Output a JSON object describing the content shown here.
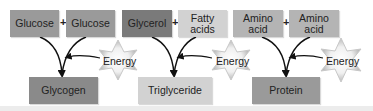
{
  "diagram": {
    "reactants": [
      {
        "label": "Glucose",
        "color": "#9a9a9a"
      },
      {
        "label": "Glucose",
        "color": "#9a9a9a"
      },
      {
        "label": "Glycerol",
        "color": "#7a7a7a"
      },
      {
        "label": "Fatty acids",
        "color": "#d2d2d2"
      },
      {
        "label": "Amino acid",
        "color": "#b4b4b4"
      },
      {
        "label": "Amino acid",
        "color": "#b4b4b4"
      }
    ],
    "plus": "+",
    "products": [
      {
        "label": "Glycogen",
        "color": "#8a8a8a"
      },
      {
        "label": "Triglyceride",
        "color": "#d2d2d2"
      },
      {
        "label": "Protein",
        "color": "#9a9a9a"
      }
    ],
    "energy_label": "Energy"
  }
}
